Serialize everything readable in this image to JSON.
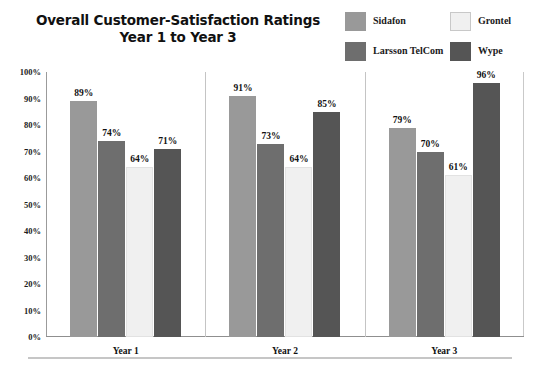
{
  "chart_data": {
    "type": "bar",
    "title": "Overall Customer-Satisfaction Ratings Year 1 to Year 3",
    "title_line1": "Overall Customer-Satisfaction Ratings",
    "title_line2": "Year 1 to Year 3",
    "xlabel": "",
    "ylabel": "",
    "ylim": [
      0,
      100
    ],
    "ytick_step": 10,
    "grid": false,
    "legend_position": "top-right",
    "categories": [
      "Year 1",
      "Year 2",
      "Year 3"
    ],
    "ytick_labels": [
      "100%",
      "90%",
      "80%",
      "70%",
      "60%",
      "50%",
      "40%",
      "30%",
      "20%",
      "10%",
      "0%"
    ],
    "ytick_values": [
      100,
      90,
      80,
      70,
      60,
      50,
      40,
      30,
      20,
      10,
      0
    ],
    "series": [
      {
        "name": "Sidafon",
        "color": "#999999",
        "values": [
          89,
          91,
          79
        ],
        "labels": [
          "89%",
          "91%",
          "79%"
        ]
      },
      {
        "name": "Larsson TelCom",
        "color": "#6e6e6e",
        "values": [
          74,
          73,
          70
        ],
        "labels": [
          "74%",
          "73%",
          "70%"
        ]
      },
      {
        "name": "Grontel",
        "color": "#f0f0f0",
        "values": [
          64,
          64,
          61
        ],
        "labels": [
          "64%",
          "64%",
          "61%"
        ]
      },
      {
        "name": "Wype",
        "color": "#555555",
        "values": [
          71,
          85,
          96
        ],
        "labels": [
          "71%",
          "85%",
          "96%"
        ]
      }
    ]
  },
  "legend": {
    "items": [
      {
        "label": "Sidafon",
        "color": "#999999"
      },
      {
        "label": "Larsson TelCom",
        "color": "#6e6e6e"
      },
      {
        "label": "Grontel",
        "color": "#f0f0f0"
      },
      {
        "label": "Wype",
        "color": "#555555"
      }
    ]
  }
}
